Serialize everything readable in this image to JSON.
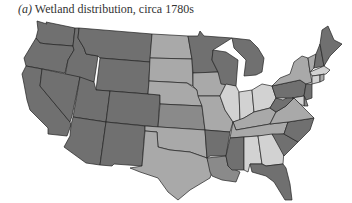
{
  "caption": {
    "label": "(a)",
    "title": "Wetland distribution, circa 1780s"
  },
  "shades": {
    "dark": "#707070",
    "mid-dark": "#8a8a8a",
    "mid-light": "#a9a9a9",
    "light": "#d2d2d2"
  },
  "states": [
    {
      "id": "WA",
      "shade": "dark"
    },
    {
      "id": "OR",
      "shade": "dark"
    },
    {
      "id": "CA",
      "shade": "dark"
    },
    {
      "id": "ID",
      "shade": "dark"
    },
    {
      "id": "NV",
      "shade": "dark"
    },
    {
      "id": "MT",
      "shade": "dark"
    },
    {
      "id": "WY",
      "shade": "dark"
    },
    {
      "id": "UT",
      "shade": "dark"
    },
    {
      "id": "CO",
      "shade": "dark"
    },
    {
      "id": "AZ",
      "shade": "dark"
    },
    {
      "id": "NM",
      "shade": "dark"
    },
    {
      "id": "ND",
      "shade": "mid-light"
    },
    {
      "id": "SD",
      "shade": "mid-light"
    },
    {
      "id": "NE",
      "shade": "mid-light"
    },
    {
      "id": "KS",
      "shade": "mid-dark"
    },
    {
      "id": "OK",
      "shade": "mid-light"
    },
    {
      "id": "TX",
      "shade": "mid-light"
    },
    {
      "id": "MN",
      "shade": "dark"
    },
    {
      "id": "IA",
      "shade": "mid-light"
    },
    {
      "id": "MO",
      "shade": "mid-light"
    },
    {
      "id": "AR",
      "shade": "dark"
    },
    {
      "id": "LA",
      "shade": "mid-dark"
    },
    {
      "id": "WI",
      "shade": "dark"
    },
    {
      "id": "MI",
      "shade": "dark"
    },
    {
      "id": "IL",
      "shade": "light"
    },
    {
      "id": "IN",
      "shade": "light"
    },
    {
      "id": "OH",
      "shade": "light"
    },
    {
      "id": "KY",
      "shade": "mid-light"
    },
    {
      "id": "TN",
      "shade": "mid-light"
    },
    {
      "id": "MS",
      "shade": "dark"
    },
    {
      "id": "AL",
      "shade": "light"
    },
    {
      "id": "GA",
      "shade": "light"
    },
    {
      "id": "FL",
      "shade": "dark"
    },
    {
      "id": "SC",
      "shade": "dark"
    },
    {
      "id": "NC",
      "shade": "dark"
    },
    {
      "id": "VA",
      "shade": "mid-light"
    },
    {
      "id": "WV",
      "shade": "dark"
    },
    {
      "id": "PA",
      "shade": "dark"
    },
    {
      "id": "NY",
      "shade": "mid-light"
    },
    {
      "id": "VT",
      "shade": "mid-light"
    },
    {
      "id": "NH",
      "shade": "dark"
    },
    {
      "id": "ME",
      "shade": "dark"
    },
    {
      "id": "MA",
      "shade": "light"
    },
    {
      "id": "CT",
      "shade": "light"
    },
    {
      "id": "RI",
      "shade": "mid-light"
    },
    {
      "id": "NJ",
      "shade": "dark"
    },
    {
      "id": "DE",
      "shade": "mid-dark"
    },
    {
      "id": "MD",
      "shade": "light"
    }
  ]
}
